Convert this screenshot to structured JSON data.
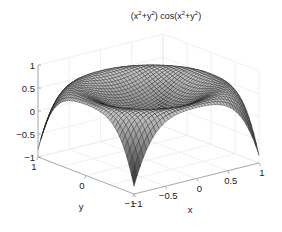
{
  "chart_data": {
    "type": "surface3d",
    "title_parts": {
      "a": "(x",
      "b": "2",
      "c": "+y",
      "d": "2",
      "e": ") cos(x",
      "f": "2",
      "g": "+y",
      "h": "2",
      "i": ")"
    },
    "function": "z = (x^2+y^2) * cos(x^2+y^2)",
    "xlabel": "x",
    "ylabel": "y",
    "zlabel": "",
    "xlim": [
      -1,
      1
    ],
    "ylim": [
      -1,
      1
    ],
    "zlim": [
      -1,
      1
    ],
    "x_ticks": [
      "-1",
      "-0.5",
      "0",
      "0.5",
      "1"
    ],
    "y_ticks": [
      "-1",
      "0",
      "1"
    ],
    "z_ticks": [
      "-1",
      "-0.5",
      "0",
      "0.5",
      "1"
    ],
    "grid": true,
    "grid_resolution": 41,
    "colormap": "gray",
    "view": {
      "azimuth": -37.5,
      "elevation": 30
    }
  },
  "colors": {
    "background": "#ffffff",
    "grid": "#e6e6e6",
    "axis": "#999999",
    "text": "#222222"
  }
}
